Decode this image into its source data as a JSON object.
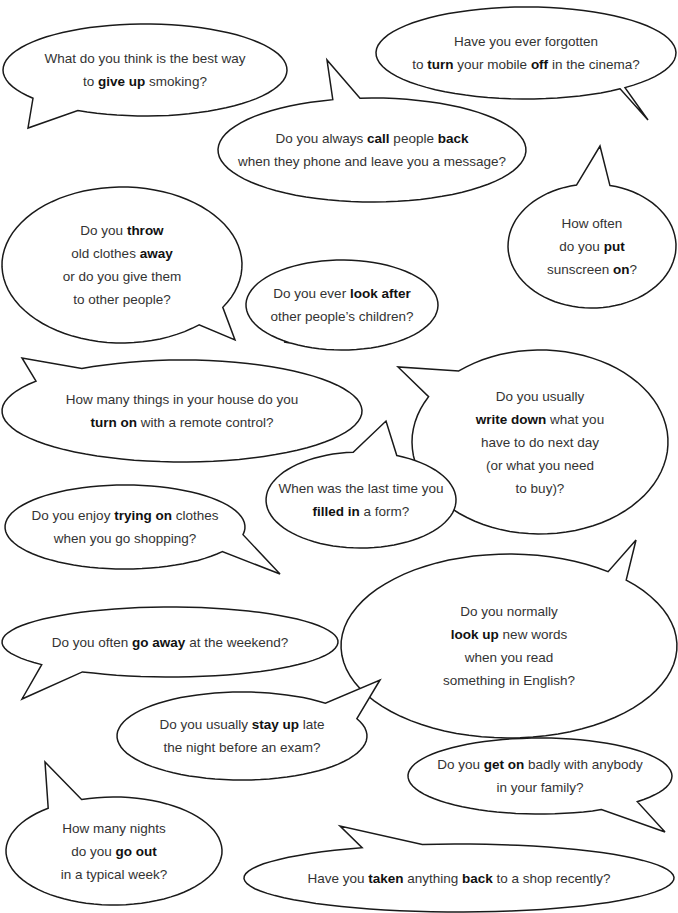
{
  "page": {
    "background": "#ffffff",
    "stroke_color": "#1a1a1a",
    "text_color": "#333333"
  },
  "bubbles": [
    {
      "id": "give-up",
      "lines": [
        [
          {
            "t": "What do you think is the best way"
          }
        ],
        [
          {
            "t": "to "
          },
          {
            "t": "give up",
            "b": true
          },
          {
            "t": " smoking?"
          }
        ]
      ]
    },
    {
      "id": "turn-off",
      "lines": [
        [
          {
            "t": "Have you ever forgotten"
          }
        ],
        [
          {
            "t": "to "
          },
          {
            "t": "turn",
            "b": true
          },
          {
            "t": " your mobile "
          },
          {
            "t": "off",
            "b": true
          },
          {
            "t": " in the cinema?"
          }
        ]
      ]
    },
    {
      "id": "call-back",
      "lines": [
        [
          {
            "t": "Do you always "
          },
          {
            "t": "call",
            "b": true
          },
          {
            "t": " people "
          },
          {
            "t": "back",
            "b": true
          }
        ],
        [
          {
            "t": "when they phone and leave you a message?"
          }
        ]
      ]
    },
    {
      "id": "throw-away",
      "lines": [
        [
          {
            "t": "Do you "
          },
          {
            "t": "throw",
            "b": true
          }
        ],
        [
          {
            "t": "old clothes "
          },
          {
            "t": "away",
            "b": true
          }
        ],
        [
          {
            "t": "or do you give them"
          }
        ],
        [
          {
            "t": "to other people?"
          }
        ]
      ]
    },
    {
      "id": "look-after",
      "lines": [
        [
          {
            "t": "Do you ever "
          },
          {
            "t": "look after",
            "b": true
          }
        ],
        [
          {
            "t": "other people’s children?"
          }
        ]
      ]
    },
    {
      "id": "put-on",
      "lines": [
        [
          {
            "t": "How often"
          }
        ],
        [
          {
            "t": "do you "
          },
          {
            "t": "put",
            "b": true
          }
        ],
        [
          {
            "t": "sunscreen "
          },
          {
            "t": "on",
            "b": true
          },
          {
            "t": "?"
          }
        ]
      ]
    },
    {
      "id": "turn-on",
      "lines": [
        [
          {
            "t": "How many things in your house do you"
          }
        ],
        [
          {
            "t": "turn on",
            "b": true
          },
          {
            "t": " with a remote control?"
          }
        ]
      ]
    },
    {
      "id": "write-down",
      "lines": [
        [
          {
            "t": "Do you usually"
          }
        ],
        [
          {
            "t": "write down",
            "b": true
          },
          {
            "t": " what you"
          }
        ],
        [
          {
            "t": "have to do next day"
          }
        ],
        [
          {
            "t": "(or what you need"
          }
        ],
        [
          {
            "t": "to buy)?"
          }
        ]
      ]
    },
    {
      "id": "filled-in",
      "lines": [
        [
          {
            "t": "When was the last time you"
          }
        ],
        [
          {
            "t": "filled in",
            "b": true
          },
          {
            "t": " a form?"
          }
        ]
      ]
    },
    {
      "id": "trying-on",
      "lines": [
        [
          {
            "t": "Do you enjoy "
          },
          {
            "t": "trying on",
            "b": true
          },
          {
            "t": " clothes"
          }
        ],
        [
          {
            "t": "when you go shopping?"
          }
        ]
      ]
    },
    {
      "id": "look-up",
      "lines": [
        [
          {
            "t": "Do you normally"
          }
        ],
        [
          {
            "t": "look up",
            "b": true
          },
          {
            "t": " new words"
          }
        ],
        [
          {
            "t": "when you read"
          }
        ],
        [
          {
            "t": "something in English?"
          }
        ]
      ]
    },
    {
      "id": "go-away",
      "lines": [
        [
          {
            "t": "Do you often "
          },
          {
            "t": "go away",
            "b": true
          },
          {
            "t": " at the weekend?"
          }
        ]
      ]
    },
    {
      "id": "stay-up",
      "lines": [
        [
          {
            "t": "Do you usually "
          },
          {
            "t": "stay up",
            "b": true
          },
          {
            "t": " late"
          }
        ],
        [
          {
            "t": "the night before an exam?"
          }
        ]
      ]
    },
    {
      "id": "get-on",
      "lines": [
        [
          {
            "t": "Do you "
          },
          {
            "t": "get on",
            "b": true
          },
          {
            "t": " badly with anybody"
          }
        ],
        [
          {
            "t": "in your family?"
          }
        ]
      ]
    },
    {
      "id": "go-out",
      "lines": [
        [
          {
            "t": "How many nights"
          }
        ],
        [
          {
            "t": "do you "
          },
          {
            "t": "go out",
            "b": true
          }
        ],
        [
          {
            "t": "in a typical week?"
          }
        ]
      ]
    },
    {
      "id": "taken-back",
      "lines": [
        [
          {
            "t": "Have you "
          },
          {
            "t": "taken",
            "b": true
          },
          {
            "t": " anything "
          },
          {
            "t": "back",
            "b": true
          },
          {
            "t": " to a shop recently?"
          }
        ]
      ]
    }
  ]
}
